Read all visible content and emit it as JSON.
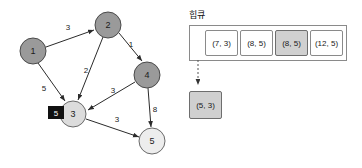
{
  "graph": {
    "nodes": [
      {
        "id": "1",
        "label": "1",
        "cx": 33,
        "cy": 51,
        "r": 13,
        "fill": "#9a9a9a",
        "stroke": "#4a4a4a",
        "state": "visited"
      },
      {
        "id": "2",
        "label": "2",
        "cx": 108,
        "cy": 25,
        "r": 13,
        "fill": "#9a9a9a",
        "stroke": "#4a4a4a",
        "state": "visited"
      },
      {
        "id": "3",
        "label": "3",
        "cx": 73,
        "cy": 114,
        "r": 13,
        "fill": "#dcdcdc",
        "stroke": "#6a6a6a",
        "state": "current"
      },
      {
        "id": "4",
        "label": "4",
        "cx": 147,
        "cy": 75,
        "r": 13,
        "fill": "#9a9a9a",
        "stroke": "#4a4a4a",
        "state": "visited"
      },
      {
        "id": "5",
        "label": "5",
        "cx": 152,
        "cy": 141,
        "r": 13,
        "fill": "#ededed",
        "stroke": "#6a6a6a",
        "state": "unvisited"
      }
    ],
    "edges": [
      {
        "from": "1",
        "to": "2",
        "weight": "3",
        "label_x": 68,
        "label_y": 27
      },
      {
        "from": "1",
        "to": "3",
        "weight": "5",
        "label_x": 44,
        "label_y": 88
      },
      {
        "from": "2",
        "to": "3",
        "weight": "2",
        "label_x": 86,
        "label_y": 70
      },
      {
        "from": "2",
        "to": "4",
        "weight": "1",
        "label_x": 131,
        "label_y": 44
      },
      {
        "from": "4",
        "to": "3",
        "weight": "3",
        "label_x": 113,
        "label_y": 90
      },
      {
        "from": "4",
        "to": "5",
        "weight": "8",
        "label_x": 155,
        "label_y": 109
      },
      {
        "from": "3",
        "to": "5",
        "weight": "3",
        "label_x": 117,
        "label_y": 119
      }
    ],
    "distance_badge": {
      "node": "3",
      "value": "5",
      "x": 48,
      "y": 106,
      "w": 16,
      "h": 13,
      "bg": "#111111",
      "fg": "#ffffff"
    }
  },
  "queue": {
    "title": "힙큐",
    "items": [
      {
        "text": "(7, 3)",
        "highlighted": false
      },
      {
        "text": "(8, 5)",
        "highlighted": false
      },
      {
        "text": "(8, 5)",
        "highlighted": true
      },
      {
        "text": "(12, 5)",
        "highlighted": false
      }
    ],
    "popped": {
      "text": "(5, 3)",
      "highlighted": true
    }
  },
  "colors": {
    "node_visited": "#9a9a9a",
    "node_current": "#dcdcdc",
    "node_unvisited": "#ededed",
    "edge": "#2b2b2b",
    "highlight": "#d0d0d0",
    "badge_bg": "#111111",
    "border": "#8a8a8a"
  }
}
